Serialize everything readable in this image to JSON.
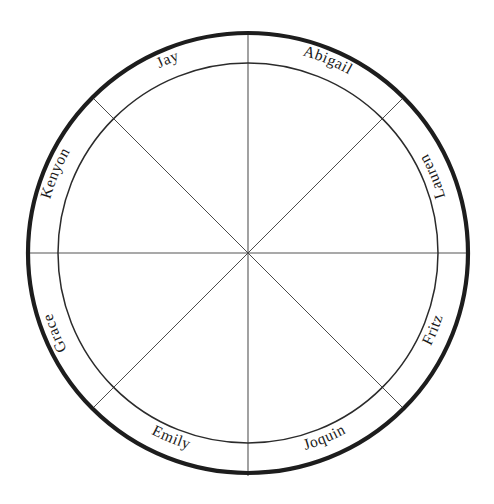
{
  "diagram": {
    "type": "wheel",
    "background_color": "#ffffff",
    "outer_circle_color": "#1d1d1d",
    "inner_circle_color": "#2b2b2b",
    "spoke_color": "#4a4a4a",
    "label_color": "#1a1a1a",
    "center": {
      "x": 248,
      "y": 253
    },
    "outer_radius": 220,
    "inner_radius": 190,
    "sector_count": 8,
    "spokes": [
      {
        "name": "spoke-vertical",
        "angle_deg": 90
      },
      {
        "name": "spoke-horizontal",
        "angle_deg": 0
      },
      {
        "name": "spoke-diagonal-ne-sw",
        "angle_deg": 45
      },
      {
        "name": "spoke-diagonal-nw-se",
        "angle_deg": 135
      }
    ],
    "labels": [
      {
        "id": "label-abigail",
        "text": "Abigail",
        "sector": 1,
        "center_angle_deg": 67.5,
        "orientation": "upright"
      },
      {
        "id": "label-jay",
        "text": "Jay",
        "sector": 2,
        "center_angle_deg": 112.5,
        "orientation": "upright"
      },
      {
        "id": "label-kenyon",
        "text": "Kenyon",
        "sector": 3,
        "center_angle_deg": 157.5,
        "orientation": "upright"
      },
      {
        "id": "label-grace",
        "text": "Grace",
        "sector": 4,
        "center_angle_deg": 202.5,
        "orientation": "upright"
      },
      {
        "id": "label-emily",
        "text": "Emily",
        "sector": 5,
        "center_angle_deg": 247.5,
        "orientation": "inverted"
      },
      {
        "id": "label-joquin",
        "text": "Joquin",
        "sector": 6,
        "center_angle_deg": 292.5,
        "orientation": "inverted"
      },
      {
        "id": "label-fritz",
        "text": "Fritz",
        "sector": 7,
        "center_angle_deg": 337.5,
        "orientation": "inverted"
      },
      {
        "id": "label-lauren",
        "text": "Lauren",
        "sector": 8,
        "center_angle_deg": 22.5,
        "orientation": "inverted"
      }
    ]
  }
}
